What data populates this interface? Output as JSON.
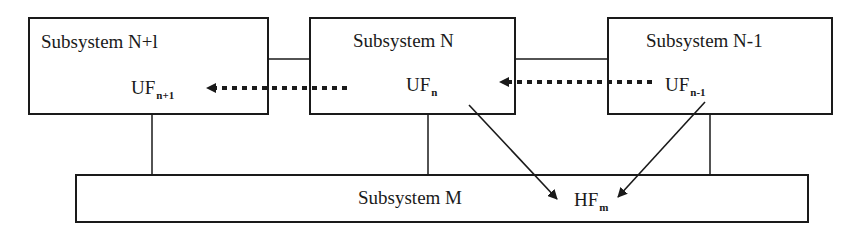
{
  "diagram": {
    "title": "",
    "boxes": [
      {
        "id": "n_plus_1",
        "label": "Subsystem N+l",
        "function": {
          "base": "UF",
          "sub": "n+1"
        }
      },
      {
        "id": "n",
        "label": "Subsystem N",
        "function": {
          "base": "UF",
          "sub": "n"
        }
      },
      {
        "id": "n_minus_1",
        "label": "Subsystem N-1",
        "function": {
          "base": "UF",
          "sub": "n-1"
        }
      },
      {
        "id": "m",
        "label": "Subsystem M",
        "function": {
          "base": "HF",
          "sub": "m"
        }
      }
    ],
    "edges": [
      {
        "from": "n",
        "to": "n_plus_1",
        "style": "dotted-arrow",
        "from_label": "UFn",
        "to_label": "UFn+1"
      },
      {
        "from": "n_minus_1",
        "to": "n",
        "style": "dotted-arrow",
        "from_label": "UFn-1",
        "to_label": "UFn"
      },
      {
        "from": "n",
        "to": "m",
        "style": "solid-arrow",
        "from_label": "UFn",
        "to_label": "HFm"
      },
      {
        "from": "n_minus_1",
        "to": "m",
        "style": "solid-arrow",
        "from_label": "UFn-1",
        "to_label": "HFm"
      },
      {
        "from": "n_plus_1",
        "to": "n",
        "style": "line"
      },
      {
        "from": "n",
        "to": "n_minus_1",
        "style": "line"
      },
      {
        "from": "n_plus_1",
        "to": "m",
        "style": "line"
      },
      {
        "from": "n",
        "to": "m",
        "style": "line"
      },
      {
        "from": "n_minus_1",
        "to": "m",
        "style": "line"
      }
    ],
    "colors": {
      "stroke": "#1a1a1a",
      "background": "#ffffff"
    }
  }
}
